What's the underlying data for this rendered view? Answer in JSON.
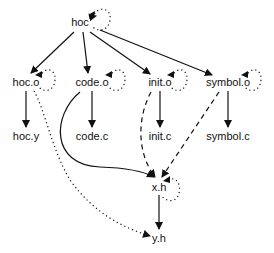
{
  "diagram": {
    "type": "dependency-graph",
    "nodes": [
      {
        "id": "hoc",
        "label": "hoc",
        "x": 80,
        "y": 22
      },
      {
        "id": "hoc_o",
        "label": "hoc.o",
        "x": 26,
        "y": 82
      },
      {
        "id": "code_o",
        "label": "code.o",
        "x": 92,
        "y": 82
      },
      {
        "id": "init_o",
        "label": "init.o",
        "x": 160,
        "y": 82
      },
      {
        "id": "symbol_o",
        "label": "symbol.o",
        "x": 228,
        "y": 82
      },
      {
        "id": "hoc_y",
        "label": "hoc.y",
        "x": 26,
        "y": 135
      },
      {
        "id": "code_c",
        "label": "code.c",
        "x": 92,
        "y": 135
      },
      {
        "id": "init_c",
        "label": "init.c",
        "x": 160,
        "y": 135
      },
      {
        "id": "symbol_c",
        "label": "symbol.c",
        "x": 228,
        "y": 135
      },
      {
        "id": "x_h",
        "label": "x.h",
        "x": 159,
        "y": 186
      },
      {
        "id": "y_h",
        "label": "y.h",
        "x": 159,
        "y": 237
      }
    ],
    "edges": [
      {
        "from": "hoc",
        "to": "hoc_o",
        "style": "solid"
      },
      {
        "from": "hoc",
        "to": "code_o",
        "style": "solid"
      },
      {
        "from": "hoc",
        "to": "init_o",
        "style": "solid"
      },
      {
        "from": "hoc",
        "to": "symbol_o",
        "style": "solid"
      },
      {
        "from": "hoc_o",
        "to": "hoc_y",
        "style": "solid"
      },
      {
        "from": "code_o",
        "to": "code_c",
        "style": "solid"
      },
      {
        "from": "init_o",
        "to": "init_c",
        "style": "solid"
      },
      {
        "from": "symbol_o",
        "to": "symbol_c",
        "style": "solid"
      },
      {
        "from": "code_o",
        "to": "x_h",
        "style": "solid-curved"
      },
      {
        "from": "init_o",
        "to": "x_h",
        "style": "dashed"
      },
      {
        "from": "symbol_o",
        "to": "x_h",
        "style": "dashed"
      },
      {
        "from": "x_h",
        "to": "y_h",
        "style": "solid"
      },
      {
        "from": "hoc_o",
        "to": "y_h",
        "style": "dotted"
      },
      {
        "from": "hoc",
        "to": "hoc",
        "style": "dotted-self-loop"
      },
      {
        "from": "hoc_o",
        "to": "hoc_o",
        "style": "dotted-self-loop"
      },
      {
        "from": "code_o",
        "to": "code_o",
        "style": "dotted-self-loop"
      },
      {
        "from": "init_o",
        "to": "init_o",
        "style": "dotted-self-loop"
      },
      {
        "from": "symbol_o",
        "to": "symbol_o",
        "style": "dotted-self-loop"
      },
      {
        "from": "x_h",
        "to": "x_h",
        "style": "dotted-self-loop"
      }
    ]
  }
}
